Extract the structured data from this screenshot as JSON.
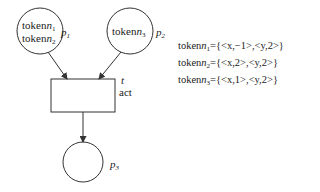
{
  "places": [
    {
      "id": "p1",
      "label": "p",
      "sub": "1",
      "tokens": [
        {
          "text": "token",
          "n": "n",
          "sub": "1"
        },
        {
          "text": "token",
          "n": "n",
          "sub": "2"
        }
      ]
    },
    {
      "id": "p2",
      "label": "p",
      "sub": "2",
      "tokens": [
        {
          "text": "token",
          "n": "n",
          "sub": "3"
        }
      ]
    },
    {
      "id": "p3",
      "label": "p",
      "sub": "3",
      "tokens": []
    }
  ],
  "transition": {
    "name": "t",
    "action": "act"
  },
  "token_definitions": [
    {
      "prefix": "token",
      "n": "n",
      "sub": "1",
      "value": "={<x,−1>,<y,2>}"
    },
    {
      "prefix": "token",
      "n": "n",
      "sub": "2",
      "value": "={<x,2>,<y,2>}"
    },
    {
      "prefix": "token",
      "n": "n",
      "sub": "3",
      "value": "={<x,1>,<y,2>}"
    }
  ],
  "colors": {
    "stroke": "#333333",
    "background": "#ffffff"
  }
}
